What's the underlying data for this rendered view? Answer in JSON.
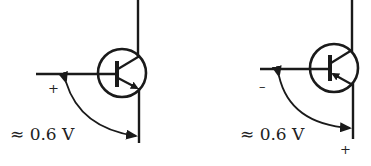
{
  "diagrams": [
    {
      "id": "npn",
      "transistor_type": "NPN",
      "base_polarity": "+",
      "voltage_label": "≈ 0.6 V"
    },
    {
      "id": "pnp",
      "transistor_type": "PNP",
      "base_polarity": "–",
      "emitter_polarity": "+",
      "voltage_label": "≈ 0.6 V"
    }
  ],
  "colors": {
    "stroke": "#1a1a1a",
    "background": "#ffffff"
  }
}
